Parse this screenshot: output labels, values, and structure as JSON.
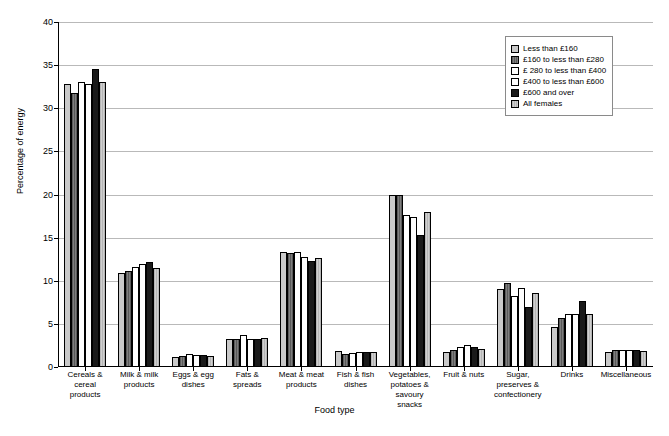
{
  "chart_data": {
    "type": "bar",
    "title": "",
    "xlabel": "Food type",
    "ylabel": "Percentage of energy",
    "ylim": [
      0,
      40
    ],
    "ytick_step": 5,
    "yticks": [
      "0",
      "5",
      "10",
      "15",
      "20",
      "25",
      "30",
      "35",
      "40"
    ],
    "grid": true,
    "legend_position": "top-right",
    "categories": [
      "Cereals &\ncereal\nproducts",
      "Milk & milk\nproducts",
      "Eggs & egg\ndishes",
      "Fats &\nspreads",
      "Meat & meat\nproducts",
      "Fish & fish\ndishes",
      "Vegetables,\npotatoes &\nsavoury\nsnacks",
      "Fruit & nuts",
      "Sugar,\npreserves &\nconfectionery",
      "Drinks",
      "Miscellaneous"
    ],
    "series": [
      {
        "name": "Less than £160",
        "pattern": "light-gray-hatch",
        "color": "#c9c9c9",
        "values": [
          32.8,
          10.9,
          1.2,
          3.2,
          13.3,
          1.9,
          20.0,
          1.7,
          9.0,
          4.6,
          1.7
        ]
      },
      {
        "name": "£160 to less than £280",
        "pattern": "dark-gray-hatch",
        "color": "#6e6e6e",
        "values": [
          31.8,
          11.1,
          1.3,
          3.2,
          13.2,
          1.5,
          19.9,
          2.0,
          9.7,
          5.7,
          2.0
        ]
      },
      {
        "name": "£ 280 to less than £400",
        "pattern": "white",
        "color": "#ffffff",
        "values": [
          33.0,
          11.6,
          1.5,
          3.7,
          13.3,
          1.6,
          17.6,
          2.3,
          8.2,
          6.1,
          2.0
        ]
      },
      {
        "name": "£400 to less than £600",
        "pattern": "white",
        "color": "#ffffff",
        "values": [
          32.8,
          11.9,
          1.4,
          3.2,
          12.8,
          1.7,
          17.4,
          2.5,
          9.2,
          6.1,
          2.0
        ]
      },
      {
        "name": "£600 and over",
        "pattern": "black",
        "color": "#1a1a1a",
        "values": [
          34.6,
          12.2,
          1.4,
          3.3,
          12.3,
          1.7,
          15.3,
          2.3,
          7.0,
          7.7,
          2.0
        ]
      },
      {
        "name": "All females",
        "pattern": "light-gray",
        "color": "#c2c2c2",
        "values": [
          33.1,
          11.5,
          1.3,
          3.4,
          12.6,
          1.7,
          18.0,
          2.1,
          8.6,
          6.1,
          1.9
        ]
      }
    ]
  }
}
